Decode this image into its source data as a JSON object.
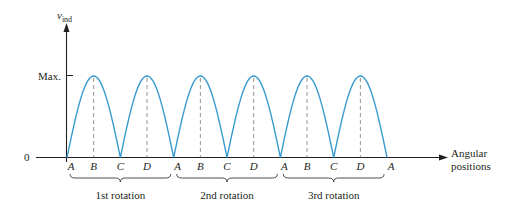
{
  "chart_data": {
    "type": "line",
    "title": "",
    "ylabel": "v",
    "ylabel_subscript": "ind",
    "xlabel_lines": [
      "Angular",
      "positions"
    ],
    "y_ticks": [
      {
        "label": "Max.",
        "value": 1
      },
      {
        "label": "0",
        "value": 0
      }
    ],
    "x_tick_labels": [
      "A",
      "B",
      "C",
      "D",
      "A",
      "B",
      "C",
      "D",
      "A",
      "B",
      "C",
      "D",
      "A"
    ],
    "x": [
      0,
      1,
      2,
      3,
      4,
      5,
      6,
      7,
      8,
      9,
      10,
      11,
      12
    ],
    "series": [
      {
        "name": "v_ind",
        "shape": "full-wave rectified sine (|sin|)",
        "values": [
          0,
          1,
          0,
          1,
          0,
          1,
          0,
          1,
          0,
          1,
          0,
          1,
          0
        ],
        "color": "#3a9bd0"
      }
    ],
    "peaks_marked_at": [
      "B",
      "D",
      "B",
      "D",
      "B",
      "D"
    ],
    "groups": [
      {
        "label": "1st rotation",
        "from": 0,
        "to": 4
      },
      {
        "label": "2nd rotation",
        "from": 4,
        "to": 8
      },
      {
        "label": "3rd rotation",
        "from": 8,
        "to": 12
      }
    ],
    "ylim": [
      0,
      1
    ],
    "grid": false
  },
  "colors": {
    "curve": "#3a9bd0",
    "axis": "#231f20",
    "dash": "#888888"
  }
}
